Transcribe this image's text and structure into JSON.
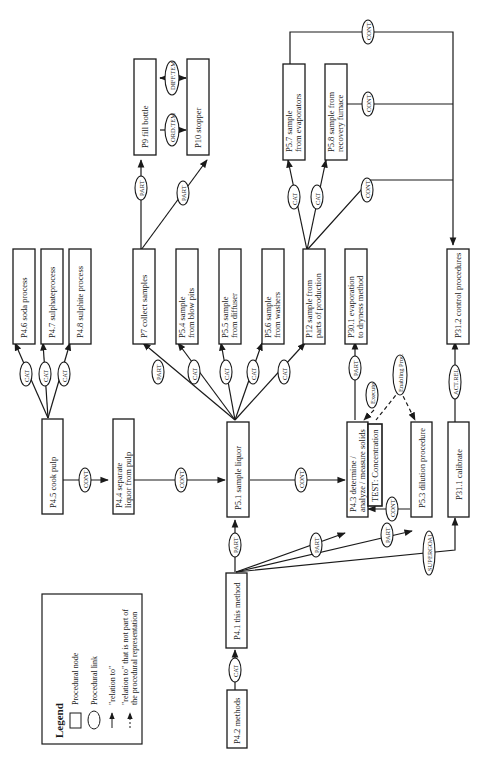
{
  "diagram": {
    "orientation": "rotated 90deg counter-clockwise",
    "legend": {
      "title": "Legend",
      "items": [
        {
          "symbol": "rectangle",
          "label": "Procedural node"
        },
        {
          "symbol": "ellipse",
          "label": "Procedural link"
        },
        {
          "symbol": "solid-arrow",
          "label": "\"relation to\""
        },
        {
          "symbol": "dashed-arrow",
          "label_line1": "\"relation to\" that is not part of",
          "label_line2": "the procedural representation"
        }
      ]
    },
    "nodes": {
      "p4_2": {
        "line1": "P4.2 methods"
      },
      "p4_1": {
        "line1": "P4.1 this method"
      },
      "p4_5": {
        "line1": "P4.5 cook pulp"
      },
      "p4_4": {
        "line1": "P4.4 separate",
        "line2": "liquor from pulp"
      },
      "p5_1": {
        "line1": "P5.1 sample liquor"
      },
      "p4_3": {
        "line1": "P4.3 determine /",
        "line2": "analyze / measure solids"
      },
      "test": {
        "line1": "TEST: Concentration"
      },
      "p5_3": {
        "line1": "P5.3 dilution procedure"
      },
      "p31_1": {
        "line1": "P31.1 calibrate"
      },
      "p4_6": {
        "line1": "P4.6 soda process"
      },
      "p4_7": {
        "line1": "P4.7 sulphateprocess"
      },
      "p4_8": {
        "line1": "P4.8 sulphite process"
      },
      "p7": {
        "line1": "P7 collect samples"
      },
      "p5_4": {
        "line1": "P5.4 sample",
        "line2": "from blow pits"
      },
      "p5_5": {
        "line1": "P5.5 sample",
        "line2": "from diffuser"
      },
      "p5_6": {
        "line1": "P5.6 sample",
        "line2": "from washers"
      },
      "p12": {
        "line1": "P12 sample from",
        "line2": "parts of production"
      },
      "p30_1": {
        "line1": "P30.1 evaporation",
        "line2": "to dryness method"
      },
      "p31_2": {
        "line1": "P31.2 control procedures"
      },
      "p9": {
        "line1": "P9 fill bottle"
      },
      "p10": {
        "line1": "P10 stopper"
      },
      "p5_7": {
        "line1": "P5.7 sample",
        "line2": "from evaporators"
      },
      "p5_8": {
        "line1": "P5.8 sample from",
        "line2": "recovery furnace"
      }
    },
    "links": {
      "cat": "CAT",
      "part": "PART",
      "cont": "CONT",
      "execute": "Execute",
      "enabling": "Enabling Proc.",
      "supergoal": "SUPERGOAL",
      "actrel": "ACT.REL",
      "ordtem": "ORD.TEM",
      "difftem": "DIFF.TEM"
    },
    "colors": {
      "ink": "#1a1a1a",
      "background": "#ffffff"
    }
  }
}
